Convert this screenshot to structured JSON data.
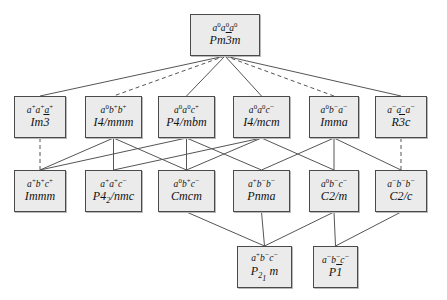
{
  "diagram": {
    "canvas": {
      "width": 447,
      "height": 300
    },
    "style": {
      "node_fill": "#ebebeb",
      "node_border": "#4a4a4a",
      "edge_color": "#555555",
      "background": "#ffffff"
    },
    "nodes": [
      {
        "id": "pm3m",
        "tilt": "a0a0a0",
        "spacegroup": "Pm3m",
        "x": 190,
        "y": 14,
        "w": 70,
        "h": 42
      },
      {
        "id": "im3",
        "tilt": "a+a+a+",
        "spacegroup": "Im3",
        "x": 14,
        "y": 96,
        "w": 52,
        "h": 42
      },
      {
        "id": "i4mmm",
        "tilt": "a0b+b+",
        "spacegroup": "I4/mmm",
        "x": 85,
        "y": 96,
        "w": 57,
        "h": 42
      },
      {
        "id": "p4mbm",
        "tilt": "a0a0c+",
        "spacegroup": "P4/mbm",
        "x": 158,
        "y": 96,
        "w": 57,
        "h": 42
      },
      {
        "id": "i4mcm",
        "tilt": "a0a0c-",
        "spacegroup": "I4/mcm",
        "x": 233,
        "y": 96,
        "w": 57,
        "h": 42
      },
      {
        "id": "imma",
        "tilt": "a0b-a-",
        "spacegroup": "Imma",
        "x": 309,
        "y": 96,
        "w": 50,
        "h": 42
      },
      {
        "id": "r3c",
        "tilt": "a-a-a-",
        "spacegroup": "R3c",
        "x": 375,
        "y": 96,
        "w": 52,
        "h": 42
      },
      {
        "id": "immm",
        "tilt": "a+b+c+",
        "spacegroup": "Immm",
        "x": 14,
        "y": 170,
        "w": 52,
        "h": 42
      },
      {
        "id": "p42nmc",
        "tilt": "a+a+c-",
        "spacegroup": "P42/nmc",
        "x": 85,
        "y": 170,
        "w": 57,
        "h": 42
      },
      {
        "id": "cmcm",
        "tilt": "a0b+c-",
        "spacegroup": "Cmcm",
        "x": 158,
        "y": 170,
        "w": 57,
        "h": 42
      },
      {
        "id": "pnma",
        "tilt": "a+b-b-",
        "spacegroup": "Pnma",
        "x": 233,
        "y": 170,
        "w": 57,
        "h": 42
      },
      {
        "id": "c2m",
        "tilt": "a0b-c-",
        "spacegroup": "C2/m",
        "x": 309,
        "y": 170,
        "w": 50,
        "h": 42
      },
      {
        "id": "c2c",
        "tilt": "a-b-b-",
        "spacegroup": "C2/c",
        "x": 375,
        "y": 170,
        "w": 52,
        "h": 42
      },
      {
        "id": "p21m",
        "tilt": "a+b-c-",
        "spacegroup": "P21m",
        "x": 237,
        "y": 246,
        "w": 55,
        "h": 42
      },
      {
        "id": "p1bar",
        "tilt": "a-b-c-",
        "spacegroup": "P1",
        "x": 313,
        "y": 246,
        "w": 45,
        "h": 42
      }
    ],
    "edges": [
      {
        "from": "pm3m",
        "to": "im3",
        "style": "solid"
      },
      {
        "from": "pm3m",
        "to": "i4mmm",
        "style": "dashed"
      },
      {
        "from": "pm3m",
        "to": "p4mbm",
        "style": "solid"
      },
      {
        "from": "pm3m",
        "to": "i4mcm",
        "style": "solid"
      },
      {
        "from": "pm3m",
        "to": "imma",
        "style": "dashed"
      },
      {
        "from": "pm3m",
        "to": "r3c",
        "style": "solid"
      },
      {
        "from": "im3",
        "to": "immm",
        "style": "dashed"
      },
      {
        "from": "i4mmm",
        "to": "immm",
        "style": "solid"
      },
      {
        "from": "i4mmm",
        "to": "p42nmc",
        "style": "solid"
      },
      {
        "from": "i4mmm",
        "to": "cmcm",
        "style": "solid"
      },
      {
        "from": "p4mbm",
        "to": "immm",
        "style": "solid"
      },
      {
        "from": "p4mbm",
        "to": "cmcm",
        "style": "solid"
      },
      {
        "from": "p4mbm",
        "to": "pnma",
        "style": "solid"
      },
      {
        "from": "i4mcm",
        "to": "p42nmc",
        "style": "solid"
      },
      {
        "from": "i4mcm",
        "to": "cmcm",
        "style": "solid"
      },
      {
        "from": "i4mcm",
        "to": "c2m",
        "style": "solid"
      },
      {
        "from": "imma",
        "to": "pnma",
        "style": "solid"
      },
      {
        "from": "imma",
        "to": "c2m",
        "style": "solid"
      },
      {
        "from": "imma",
        "to": "c2c",
        "style": "solid"
      },
      {
        "from": "r3c",
        "to": "c2c",
        "style": "dashed"
      },
      {
        "from": "cmcm",
        "to": "p21m",
        "style": "solid"
      },
      {
        "from": "pnma",
        "to": "p21m",
        "style": "solid"
      },
      {
        "from": "c2m",
        "to": "p21m",
        "style": "solid"
      },
      {
        "from": "c2m",
        "to": "p1bar",
        "style": "solid"
      },
      {
        "from": "c2c",
        "to": "p1bar",
        "style": "solid"
      }
    ]
  }
}
